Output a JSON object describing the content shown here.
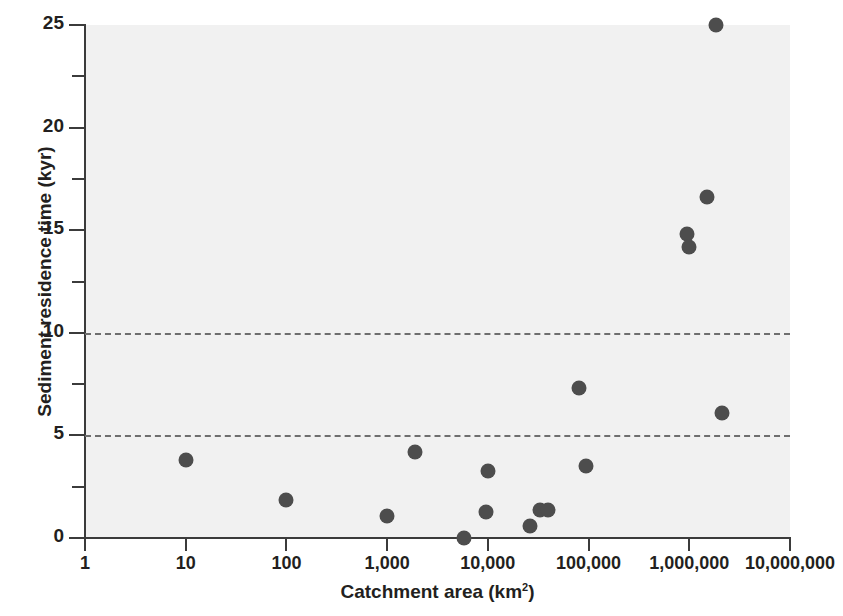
{
  "chart_data": {
    "type": "scatter",
    "title": "",
    "xlabel": "Catchment area (km2)",
    "xlabel_base": "Catchment area (km",
    "xlabel_sup": "2",
    "xlabel_tail": ")",
    "ylabel": "Sediment residence time (kyr)",
    "xscale": "log",
    "yscale": "linear",
    "xlim": [
      1,
      10000000
    ],
    "ylim": [
      0,
      25
    ],
    "grid": false,
    "legend": null,
    "xticks": [
      1,
      10,
      100,
      1000,
      10000,
      100000,
      1000000,
      10000000
    ],
    "xtick_labels": [
      "1",
      "10",
      "100",
      "1,000",
      "10,000",
      "100,000",
      "1,000,000",
      "10,000,000"
    ],
    "yticks": [
      0,
      5,
      10,
      15,
      20,
      25
    ],
    "ytick_labels": [
      "0",
      "5",
      "10",
      "15",
      "20",
      "25"
    ],
    "yticks_minor": [
      2.5,
      7.5,
      12.5,
      17.5,
      22.5
    ],
    "reference_lines": [
      {
        "y": 5,
        "style": "dashed",
        "color": "#6e6e6e"
      },
      {
        "y": 10,
        "style": "dashed",
        "color": "#6e6e6e"
      }
    ],
    "marker_color": "#4d4d4d",
    "plot_background": "#f1f1f1",
    "points": [
      {
        "x": 10,
        "y": 3.8
      },
      {
        "x": 100,
        "y": 1.85
      },
      {
        "x": 1000,
        "y": 1.05
      },
      {
        "x": 1900,
        "y": 4.2
      },
      {
        "x": 5800,
        "y": 0.0
      },
      {
        "x": 9500,
        "y": 1.25
      },
      {
        "x": 10000,
        "y": 3.25
      },
      {
        "x": 26000,
        "y": 0.6
      },
      {
        "x": 33000,
        "y": 1.35
      },
      {
        "x": 40000,
        "y": 1.35
      },
      {
        "x": 80000,
        "y": 7.3
      },
      {
        "x": 95000,
        "y": 3.5
      },
      {
        "x": 950000,
        "y": 14.8
      },
      {
        "x": 1000000,
        "y": 14.2
      },
      {
        "x": 1500000,
        "y": 16.6
      },
      {
        "x": 1850000,
        "y": 25.0
      },
      {
        "x": 2100000,
        "y": 6.1
      }
    ]
  }
}
